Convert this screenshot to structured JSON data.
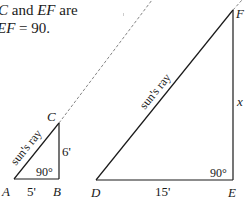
{
  "text": {
    "line1_a": "C",
    "line1_b": " and ",
    "line1_c": "EF",
    "line1_d": " are",
    "line2_a": "EF",
    "line2_b": " = 90."
  },
  "small_triangle": {
    "vertices": {
      "A": "A",
      "B": "B",
      "C": "C"
    },
    "base_label": "5'",
    "height_label": "6'",
    "angle_label": "90°",
    "ray_label": "sun's ray"
  },
  "large_triangle": {
    "vertices": {
      "D": "D",
      "E": "E",
      "F": "F"
    },
    "base_label": "15'",
    "height_label": "x",
    "angle_label": "90°",
    "ray_label": "sun's ray"
  },
  "colors": {
    "line": "#1a1a1a",
    "dashed": "#666666"
  }
}
